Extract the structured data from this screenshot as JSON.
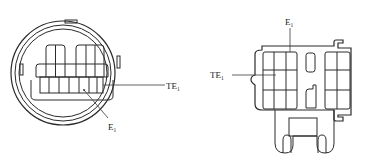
{
  "diagram": {
    "type": "connector-pinout",
    "connectors": [
      {
        "id": "round-connector",
        "shape": "circular",
        "labels": [
          {
            "id": "te1",
            "base": "TE",
            "subscript": "1"
          },
          {
            "id": "e1",
            "base": "E",
            "subscript": "1"
          }
        ]
      },
      {
        "id": "rect-connector",
        "shape": "rectangular",
        "labels": [
          {
            "id": "e1",
            "base": "E",
            "subscript": "1"
          },
          {
            "id": "te1",
            "base": "TE",
            "subscript": "1"
          }
        ]
      }
    ]
  },
  "left": {
    "te1": {
      "base": "TE",
      "sub": "1"
    },
    "e1": {
      "base": "E",
      "sub": "1"
    }
  },
  "right": {
    "e1": {
      "base": "E",
      "sub": "1"
    },
    "te1": {
      "base": "TE",
      "sub": "1"
    }
  },
  "colors": {
    "line": "#2a2a2a",
    "background": "#ffffff"
  }
}
